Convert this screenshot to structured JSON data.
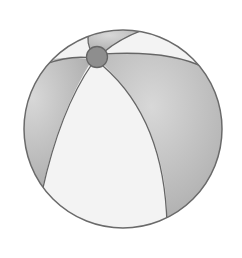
{
  "image": {
    "subject": "beach ball",
    "colors": {
      "background": "#ffffff",
      "outline": "#666666",
      "panel_dark": "#b5b5b5",
      "panel_light": "#f2f2f2",
      "cap": "#8e8e8e"
    }
  }
}
